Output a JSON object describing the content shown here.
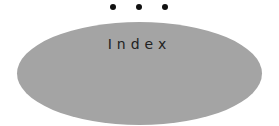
{
  "diagram": {
    "continuation_dots": 3,
    "node": {
      "label": "Index",
      "shape": "ellipse",
      "fill": "#a4a4a4"
    }
  }
}
